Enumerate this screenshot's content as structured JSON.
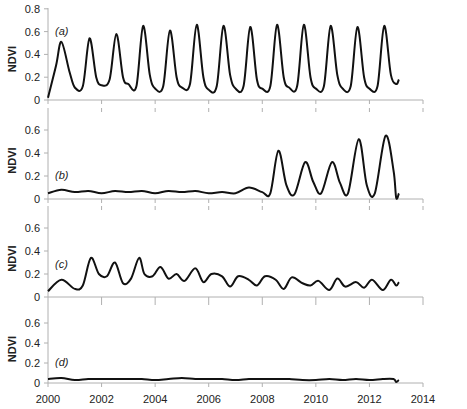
{
  "chart_data": [
    {
      "type": "line",
      "panel_label": "(a)",
      "ylabel": "NDVI",
      "xlabel": "",
      "ylim": [
        0,
        0.8
      ],
      "yticks": [
        "0",
        "0.2",
        "0.4",
        "0.6",
        "0.8"
      ],
      "grid": false,
      "x": [
        2000.0,
        2000.3,
        2000.5,
        2000.8,
        2001.0,
        2001.3,
        2001.55,
        2001.8,
        2002.0,
        2002.3,
        2002.55,
        2002.8,
        2003.0,
        2003.3,
        2003.55,
        2003.8,
        2004.0,
        2004.3,
        2004.55,
        2004.8,
        2005.0,
        2005.3,
        2005.55,
        2005.8,
        2006.0,
        2006.3,
        2006.55,
        2006.8,
        2007.0,
        2007.3,
        2007.55,
        2007.8,
        2008.0,
        2008.3,
        2008.55,
        2008.8,
        2009.0,
        2009.3,
        2009.55,
        2009.8,
        2010.0,
        2010.3,
        2010.55,
        2010.8,
        2011.0,
        2011.3,
        2011.55,
        2011.8,
        2012.0,
        2012.3,
        2012.55,
        2012.8,
        2013.0,
        2013.1
      ],
      "values": [
        0.02,
        0.3,
        0.51,
        0.25,
        0.11,
        0.12,
        0.54,
        0.2,
        0.13,
        0.18,
        0.58,
        0.2,
        0.14,
        0.12,
        0.65,
        0.22,
        0.1,
        0.12,
        0.61,
        0.2,
        0.11,
        0.14,
        0.66,
        0.2,
        0.09,
        0.12,
        0.65,
        0.22,
        0.1,
        0.12,
        0.64,
        0.18,
        0.1,
        0.12,
        0.66,
        0.2,
        0.11,
        0.12,
        0.66,
        0.2,
        0.1,
        0.12,
        0.65,
        0.22,
        0.1,
        0.12,
        0.64,
        0.2,
        0.1,
        0.12,
        0.65,
        0.22,
        0.14,
        0.18
      ]
    },
    {
      "type": "line",
      "panel_label": "(b)",
      "ylabel": "NDVI",
      "xlabel": "",
      "ylim": [
        0,
        0.7
      ],
      "yticks": [
        "0",
        "0.2",
        "0.4",
        "0.6"
      ],
      "grid": false,
      "x": [
        2000.0,
        2000.5,
        2001.0,
        2001.5,
        2002.0,
        2002.5,
        2003.0,
        2003.5,
        2004.0,
        2004.5,
        2005.0,
        2005.5,
        2006.0,
        2006.5,
        2007.0,
        2007.5,
        2008.0,
        2008.3,
        2008.6,
        2008.9,
        2009.2,
        2009.6,
        2009.9,
        2010.2,
        2010.6,
        2010.9,
        2011.2,
        2011.6,
        2011.9,
        2012.2,
        2012.6,
        2012.9,
        2013.0,
        2013.1
      ],
      "values": [
        0.05,
        0.08,
        0.06,
        0.07,
        0.05,
        0.07,
        0.06,
        0.07,
        0.05,
        0.07,
        0.06,
        0.07,
        0.05,
        0.06,
        0.05,
        0.1,
        0.06,
        0.05,
        0.42,
        0.12,
        0.04,
        0.32,
        0.15,
        0.05,
        0.32,
        0.14,
        0.05,
        0.52,
        0.12,
        0.05,
        0.55,
        0.25,
        0.01,
        0.05
      ]
    },
    {
      "type": "line",
      "panel_label": "(c)",
      "ylabel": "NDVI",
      "xlabel": "",
      "ylim": [
        0,
        0.7
      ],
      "yticks": [
        "0",
        "0.2",
        "0.4",
        "0.6"
      ],
      "grid": false,
      "x": [
        2000.0,
        2000.5,
        2001.0,
        2001.3,
        2001.6,
        2001.9,
        2002.2,
        2002.5,
        2002.8,
        2003.1,
        2003.4,
        2003.6,
        2003.9,
        2004.2,
        2004.5,
        2004.8,
        2005.1,
        2005.5,
        2005.8,
        2006.1,
        2006.5,
        2006.8,
        2007.1,
        2007.5,
        2007.8,
        2008.1,
        2008.5,
        2008.8,
        2009.1,
        2009.5,
        2009.8,
        2010.1,
        2010.5,
        2010.8,
        2011.1,
        2011.5,
        2011.8,
        2012.1,
        2012.5,
        2012.8,
        2013.0,
        2013.1
      ],
      "values": [
        0.05,
        0.15,
        0.07,
        0.1,
        0.34,
        0.2,
        0.18,
        0.3,
        0.12,
        0.16,
        0.34,
        0.2,
        0.18,
        0.26,
        0.16,
        0.2,
        0.14,
        0.25,
        0.13,
        0.2,
        0.18,
        0.09,
        0.18,
        0.15,
        0.1,
        0.18,
        0.15,
        0.07,
        0.17,
        0.12,
        0.1,
        0.14,
        0.06,
        0.16,
        0.09,
        0.13,
        0.08,
        0.15,
        0.06,
        0.15,
        0.1,
        0.13
      ]
    },
    {
      "type": "line",
      "panel_label": "(d)",
      "ylabel": "NDVI",
      "xlabel": "",
      "ylim": [
        0,
        0.7
      ],
      "yticks": [
        "0",
        "0.2",
        "0.4",
        "0.6"
      ],
      "xticks": [
        "2000",
        "2002",
        "2004",
        "2006",
        "2008",
        "2010",
        "2012",
        "2014"
      ],
      "xlim": [
        2000,
        2014
      ],
      "grid": false,
      "x": [
        2000.0,
        2000.5,
        2001.0,
        2001.5,
        2002.0,
        2002.5,
        2003.0,
        2003.5,
        2004.0,
        2004.5,
        2005.0,
        2005.5,
        2006.0,
        2006.5,
        2007.0,
        2007.5,
        2008.0,
        2008.5,
        2009.0,
        2009.5,
        2010.0,
        2010.5,
        2011.0,
        2011.5,
        2012.0,
        2012.5,
        2012.9,
        2013.0,
        2013.1
      ],
      "values": [
        0.04,
        0.05,
        0.03,
        0.04,
        0.04,
        0.04,
        0.04,
        0.04,
        0.03,
        0.04,
        0.05,
        0.04,
        0.04,
        0.04,
        0.03,
        0.04,
        0.04,
        0.04,
        0.04,
        0.03,
        0.03,
        0.04,
        0.03,
        0.04,
        0.03,
        0.04,
        0.04,
        0.01,
        0.03
      ]
    }
  ]
}
